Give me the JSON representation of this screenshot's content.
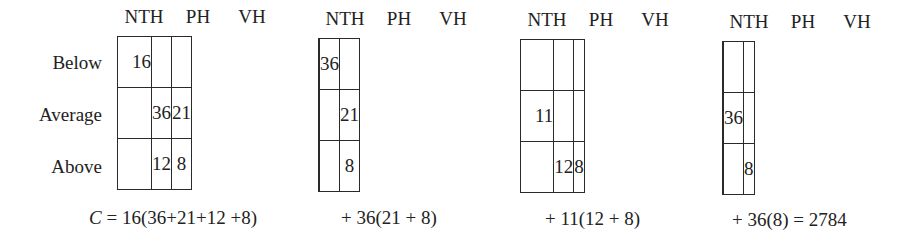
{
  "row_labels": [
    "Below",
    "Average",
    "Above"
  ],
  "column_labels": [
    "NTH",
    "PH",
    "VH"
  ],
  "panels": [
    {
      "cells": [
        [
          "16",
          "",
          ""
        ],
        [
          "",
          "36",
          "21"
        ],
        [
          "",
          "12",
          "8"
        ]
      ],
      "cell_align": [
        [
          "left",
          "center",
          "center"
        ],
        [
          "center",
          "center",
          "center"
        ],
        [
          "center",
          "center",
          "center"
        ]
      ],
      "formula_prefix": "C",
      "formula": " = 16(36+21+12 +8)"
    },
    {
      "cells": [
        [
          "",
          "36",
          ""
        ],
        [
          "",
          "",
          "21"
        ],
        [
          "",
          "",
          "8"
        ]
      ],
      "formula": "+ 36(21 + 8)"
    },
    {
      "cells": [
        [
          "",
          "",
          ""
        ],
        [
          "11",
          "",
          ""
        ],
        [
          "",
          "12",
          "8"
        ]
      ],
      "formula": "+ 11(12 + 8)"
    },
    {
      "cells": [
        [
          "",
          "",
          ""
        ],
        [
          "",
          "36",
          ""
        ],
        [
          "",
          "",
          "8"
        ]
      ],
      "formula": "+ 36(8) = 2784"
    }
  ],
  "result": "2784"
}
